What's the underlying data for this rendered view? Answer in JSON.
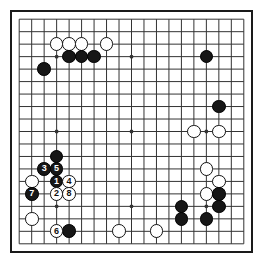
{
  "diagram": {
    "type": "go-board-diagram",
    "board_size": 19,
    "move_range": "1-8",
    "colors": {
      "black_stone": "#161616",
      "white_stone": "#ffffff",
      "grid_line": "#333333",
      "board_border": "#1a1a1a",
      "background": "#ffffff",
      "black_label_text": "#ffffff",
      "white_label_text": "#111111"
    },
    "grid": {
      "lines": 19,
      "star_points": [
        {
          "col": 4,
          "row": 4
        },
        {
          "col": 10,
          "row": 4
        },
        {
          "col": 16,
          "row": 4
        },
        {
          "col": 4,
          "row": 10
        },
        {
          "col": 10,
          "row": 10
        },
        {
          "col": 16,
          "row": 10
        },
        {
          "col": 4,
          "row": 16
        },
        {
          "col": 10,
          "row": 16
        },
        {
          "col": 16,
          "row": 16
        }
      ]
    },
    "numbered_moves": [
      {
        "number": "1",
        "color": "black",
        "col": 4,
        "row": 14
      },
      {
        "number": "2",
        "color": "white",
        "col": 4,
        "row": 15
      },
      {
        "number": "3",
        "color": "black",
        "col": 3,
        "row": 13
      },
      {
        "number": "4",
        "color": "white",
        "col": 5,
        "row": 14
      },
      {
        "number": "5",
        "color": "black",
        "col": 4,
        "row": 13
      },
      {
        "number": "6",
        "color": "white",
        "col": 4,
        "row": 18
      },
      {
        "number": "7",
        "color": "black",
        "col": 2,
        "row": 15
      },
      {
        "number": "8",
        "color": "white",
        "col": 5,
        "row": 15
      }
    ],
    "stones": [
      {
        "color": "white",
        "col": 4,
        "row": 3,
        "label": ""
      },
      {
        "color": "white",
        "col": 5,
        "row": 3,
        "label": ""
      },
      {
        "color": "white",
        "col": 6,
        "row": 3,
        "label": ""
      },
      {
        "color": "white",
        "col": 8,
        "row": 3,
        "label": ""
      },
      {
        "color": "black",
        "col": 5,
        "row": 4,
        "label": ""
      },
      {
        "color": "black",
        "col": 6,
        "row": 4,
        "label": ""
      },
      {
        "color": "black",
        "col": 7,
        "row": 4,
        "label": ""
      },
      {
        "color": "black",
        "col": 16,
        "row": 4,
        "label": ""
      },
      {
        "color": "black",
        "col": 3,
        "row": 5,
        "label": ""
      },
      {
        "color": "black",
        "col": 17,
        "row": 8,
        "label": ""
      },
      {
        "color": "white",
        "col": 15,
        "row": 10,
        "label": ""
      },
      {
        "color": "white",
        "col": 17,
        "row": 10,
        "label": ""
      },
      {
        "color": "black",
        "col": 4,
        "row": 12,
        "label": ""
      },
      {
        "color": "black",
        "col": 3,
        "row": 13,
        "label": "3"
      },
      {
        "color": "black",
        "col": 4,
        "row": 13,
        "label": "5"
      },
      {
        "color": "white",
        "col": 2,
        "row": 14,
        "label": ""
      },
      {
        "color": "black",
        "col": 4,
        "row": 14,
        "label": "1"
      },
      {
        "color": "white",
        "col": 5,
        "row": 14,
        "label": "4"
      },
      {
        "color": "black",
        "col": 2,
        "row": 15,
        "label": "7"
      },
      {
        "color": "white",
        "col": 4,
        "row": 15,
        "label": "2"
      },
      {
        "color": "white",
        "col": 5,
        "row": 15,
        "label": "8"
      },
      {
        "color": "white",
        "col": 16,
        "row": 13,
        "label": ""
      },
      {
        "color": "white",
        "col": 17,
        "row": 14,
        "label": ""
      },
      {
        "color": "white",
        "col": 16,
        "row": 15,
        "label": ""
      },
      {
        "color": "black",
        "col": 17,
        "row": 15,
        "label": ""
      },
      {
        "color": "black",
        "col": 17,
        "row": 16,
        "label": ""
      },
      {
        "color": "black",
        "col": 14,
        "row": 16,
        "label": ""
      },
      {
        "color": "white",
        "col": 2,
        "row": 17,
        "label": ""
      },
      {
        "color": "black",
        "col": 14,
        "row": 17,
        "label": ""
      },
      {
        "color": "black",
        "col": 16,
        "row": 17,
        "label": ""
      },
      {
        "color": "white",
        "col": 4,
        "row": 18,
        "label": "6"
      },
      {
        "color": "black",
        "col": 5,
        "row": 18,
        "label": ""
      },
      {
        "color": "white",
        "col": 9,
        "row": 18,
        "label": ""
      },
      {
        "color": "white",
        "col": 12,
        "row": 18,
        "label": ""
      }
    ]
  }
}
